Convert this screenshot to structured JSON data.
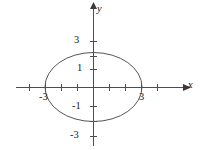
{
  "figure": {
    "background_color": "#ffffff",
    "curve_color": "#555555",
    "axis_color": "#4d4d4d",
    "text_color": "#1a1a1a"
  },
  "axes": {
    "x_axis_name": "x",
    "y_axis_name": "y",
    "x_tick_labels": [
      "-3",
      "3"
    ],
    "y_tick_labels": [
      "3",
      "1",
      "-1",
      "-3"
    ],
    "x_label_minus3": "-3",
    "x_label_3": "3",
    "y_label_3": "3",
    "y_label_1": "1",
    "y_label_minus1": "-1",
    "y_label_minus3": "-3"
  },
  "chart_data": {
    "type": "line",
    "title": "",
    "xlabel": "x",
    "ylabel": "y",
    "xlim": [
      -4.8,
      5.8
    ],
    "ylim": [
      -4.2,
      4.6
    ],
    "grid": false,
    "legend": null,
    "x_ticks": [
      -4,
      -3,
      -2,
      -1,
      1,
      2,
      3,
      4
    ],
    "y_ticks": [
      -3,
      -2,
      -1,
      1,
      2,
      3
    ],
    "x_tick_labels_shown": {
      "-3": "-3",
      "3": "3"
    },
    "y_tick_labels_shown": {
      "3": "3",
      "1": "1",
      "-1": "-1",
      "-3": "-3"
    },
    "series": [
      {
        "name": "ellipse",
        "shape": "ellipse",
        "center": [
          0,
          0
        ],
        "semi_axis_x": 3,
        "semi_axis_y": 2.3,
        "equation": "x^2/9 + y^2/5.29 = 1",
        "x_intercepts": [
          -3,
          3
        ],
        "y_intercepts": [
          -2.3,
          2.3
        ],
        "closed": true
      }
    ]
  }
}
